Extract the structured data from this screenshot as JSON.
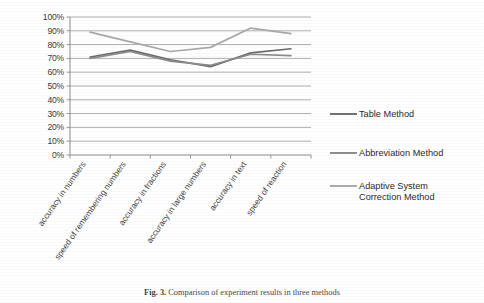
{
  "chart_data": {
    "type": "line",
    "title": "",
    "xlabel": "",
    "ylabel": "",
    "ylim": [
      0,
      100
    ],
    "ytick_labels": [
      "100%",
      "90%",
      "80%",
      "70%",
      "60%",
      "50%",
      "40%",
      "30%",
      "20%",
      "10%",
      "0%"
    ],
    "ytick_values": [
      100,
      90,
      80,
      70,
      60,
      50,
      40,
      30,
      20,
      10,
      0
    ],
    "grid": true,
    "legend_position": "right",
    "categories": [
      "accuracy in numbers",
      "speed of remembering numbers",
      "accuracy in fractions",
      "accuracy in large numbers",
      "accuracy in text",
      "speed of reaction"
    ],
    "series": [
      {
        "name": "Table Method",
        "color": "#6b6b6b",
        "values": [
          71,
          76,
          69,
          64,
          74,
          77
        ]
      },
      {
        "name": "Abbreviation Method",
        "color": "#8a8a8a",
        "values": [
          70,
          75,
          68,
          65,
          73,
          72
        ]
      },
      {
        "name": "Adaptive System Correction Method",
        "color": "#a9a9a9",
        "values": [
          89,
          82,
          75,
          78,
          92,
          88
        ]
      }
    ]
  },
  "legend": {
    "items": [
      {
        "label": "Table Method",
        "label_line2": "",
        "color": "#6b6b6b"
      },
      {
        "label": "Abbreviation Method",
        "label_line2": "",
        "color": "#8a8a8a"
      },
      {
        "label": "Adaptive System",
        "label_line2": "Correction Method",
        "color": "#a9a9a9"
      }
    ]
  },
  "caption": {
    "figure_number": "Fig. 3.",
    "text": "Comparison of experiment results in three methods"
  }
}
